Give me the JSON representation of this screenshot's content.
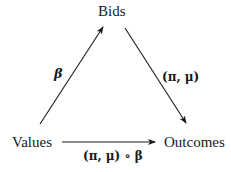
{
  "diagram": {
    "nodes": {
      "top": {
        "label": "Bids"
      },
      "left": {
        "label": "Values"
      },
      "right": {
        "label": "Outcomes"
      }
    },
    "edges": {
      "values_to_bids": {
        "from": "Values",
        "to": "Bids",
        "label": "β"
      },
      "bids_to_outcomes": {
        "from": "Bids",
        "to": "Outcomes",
        "label": "(π, μ)"
      },
      "values_to_outcomes": {
        "from": "Values",
        "to": "Outcomes",
        "label": "(π, μ) ∘ β"
      }
    },
    "colors": {
      "line": "#1a1a1a",
      "background": "#ffffff"
    }
  }
}
